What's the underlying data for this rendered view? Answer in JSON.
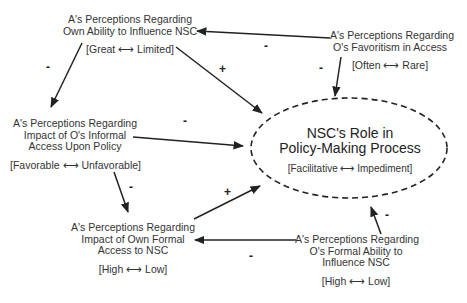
{
  "diagram": {
    "nodes": {
      "own_ability": {
        "title": [
          "A's Perceptions Regarding",
          "Own Ability to Influence NSC"
        ],
        "scale": "[Great ⟷ Limited]"
      },
      "favoritism": {
        "title": [
          "A's Perceptions Regarding",
          "O's Favoritism in Access"
        ],
        "scale": "[Often ⟷ Rare]"
      },
      "informal_access": {
        "title": [
          "A's Perceptions Regarding",
          "Impact of O's Informal",
          "Access Upon Policy"
        ],
        "scale": "[Favorable ⟷ Unfavorable]"
      },
      "nsc_role": {
        "title": [
          "NSC's Role in",
          "Policy-Making Process"
        ],
        "scale": "[Facilitative ⟷ Impediment]"
      },
      "own_formal_access": {
        "title": [
          "A's Perceptions Regarding",
          "Impact of Own Formal",
          "Access to NSC"
        ],
        "scale": "[High ⟷ Low]"
      },
      "o_formal_ability": {
        "title": [
          "A's Perceptions Regarding",
          "O's Formal Ability to",
          "Influence NSC"
        ],
        "scale": "[High ⟷ Low]"
      }
    },
    "edges": [
      {
        "from": "favoritism",
        "to": "own_ability",
        "sign": "-"
      },
      {
        "from": "favoritism",
        "to": "nsc_role",
        "sign": "-"
      },
      {
        "from": "own_ability",
        "to": "informal_access",
        "sign": "-"
      },
      {
        "from": "own_ability",
        "to": "nsc_role",
        "sign": "+"
      },
      {
        "from": "informal_access",
        "to": "nsc_role",
        "sign": "-"
      },
      {
        "from": "informal_access",
        "to": "own_formal_access",
        "sign": "-"
      },
      {
        "from": "own_formal_access",
        "to": "nsc_role",
        "sign": "+"
      },
      {
        "from": "o_formal_ability",
        "to": "own_formal_access",
        "sign": "-"
      },
      {
        "from": "o_formal_ability",
        "to": "nsc_role",
        "sign": "-"
      }
    ],
    "signs": {
      "fav_to_own": "-",
      "fav_to_nsc": "-",
      "own_to_inf": "-",
      "own_to_nsc": "+",
      "inf_to_nsc": "-",
      "inf_to_formal": "-",
      "formal_to_nsc": "+",
      "oformal_to_formal": "-",
      "oformal_to_nsc": "-"
    }
  }
}
